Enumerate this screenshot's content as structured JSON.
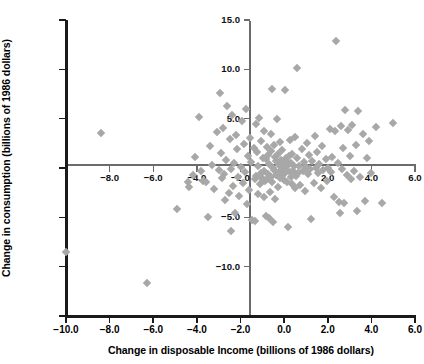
{
  "chart_data": {
    "type": "scatter",
    "title": "",
    "xlabel": "Change in disposable Income (billions of 1986 dollars)",
    "ylabel": "Change in consumption (billions of 1986 dollars)",
    "xlim": [
      -10.0,
      6.0
    ],
    "ylim": [
      -15.0,
      15.0
    ],
    "grid": false,
    "legend": "none",
    "marker": "diamond",
    "marker_color": "#a8a8a8",
    "axis_color": "#1a1a1a",
    "inner_axis_color": "#6b6b6b",
    "outer_xticks": [
      "-10.0",
      "-8.0",
      "-6.0",
      "-4.0",
      "-2.0",
      "0.0",
      "2.0",
      "4.0",
      "6.0"
    ],
    "outer_xtick_values": [
      -10.0,
      -8.0,
      -6.0,
      -4.0,
      -2.0,
      0.0,
      2.0,
      4.0,
      6.0
    ],
    "outer_yticks": [
      "15.0",
      "10.0",
      "5.0",
      "0.0",
      "-5.0",
      "-10.0",
      "-15.0"
    ],
    "outer_ytick_values": [
      15.0,
      10.0,
      5.0,
      0.0,
      -5.0,
      -10.0,
      -15.0
    ],
    "inner_xticks": [
      "-8.0",
      "-6.0",
      "-4.0",
      "-2.0",
      "2.0",
      "4.0",
      "6.0"
    ],
    "inner_xtick_values": [
      -8.0,
      -6.0,
      -4.0,
      -2.0,
      2.0,
      4.0,
      6.0
    ],
    "inner_yticks": [
      "15.0",
      "10.0",
      "5.0",
      "-5.0",
      "-10.0"
    ],
    "inner_ytick_values": [
      15.0,
      10.0,
      5.0,
      -5.0,
      -10.0
    ],
    "points": [
      [
        -10.0,
        -8.5
      ],
      [
        -8.4,
        3.5
      ],
      [
        -6.3,
        -11.7
      ],
      [
        -4.9,
        -4.2
      ],
      [
        -4.4,
        -1.4
      ],
      [
        -4.2,
        -0.7
      ],
      [
        -4.1,
        1.1
      ],
      [
        -3.8,
        -0.3
      ],
      [
        -3.7,
        -1.3
      ],
      [
        -3.6,
        -1.4
      ],
      [
        -3.5,
        -5.0
      ],
      [
        -3.4,
        2.2
      ],
      [
        -3.3,
        0.3
      ],
      [
        -3.2,
        -2.1
      ],
      [
        -3.1,
        3.6
      ],
      [
        -3.0,
        -0.2
      ],
      [
        -2.95,
        7.6
      ],
      [
        -2.9,
        1.5
      ],
      [
        -2.85,
        -1.0
      ],
      [
        -2.8,
        4.1
      ],
      [
        -2.75,
        -0.6
      ],
      [
        -2.7,
        -3.2
      ],
      [
        -2.65,
        0.8
      ],
      [
        -2.6,
        6.3
      ],
      [
        -2.55,
        -2.5
      ],
      [
        -2.5,
        2.9
      ],
      [
        -2.45,
        -0.1
      ],
      [
        -2.4,
        5.4
      ],
      [
        -2.35,
        -1.8
      ],
      [
        -2.3,
        0.5
      ],
      [
        -2.25,
        -4.6
      ],
      [
        -2.2,
        3.3
      ],
      [
        -2.15,
        1.9
      ],
      [
        -2.1,
        -0.9
      ],
      [
        -2.05,
        -2.8
      ],
      [
        -2.0,
        0.1
      ],
      [
        -1.95,
        4.8
      ],
      [
        -1.9,
        -1.5
      ],
      [
        -1.85,
        2.4
      ],
      [
        -1.8,
        -0.4
      ],
      [
        -1.75,
        6.0
      ],
      [
        -1.7,
        -3.6
      ],
      [
        -1.65,
        1.2
      ],
      [
        -1.6,
        -2.2
      ],
      [
        -1.55,
        3.0
      ],
      [
        -1.5,
        0.6
      ],
      [
        -1.45,
        -5.3
      ],
      [
        -1.4,
        2.0
      ],
      [
        -1.35,
        -1.1
      ],
      [
        -1.3,
        4.5
      ],
      [
        -1.28,
        -0.8
      ],
      [
        -1.25,
        1.6
      ],
      [
        -1.2,
        -2.6
      ],
      [
        -1.18,
        0.2
      ],
      [
        -1.15,
        5.1
      ],
      [
        -1.1,
        -1.6
      ],
      [
        -1.08,
        -0.5
      ],
      [
        -1.05,
        2.7
      ],
      [
        -1.0,
        -1.0
      ],
      [
        -0.98,
        1.0
      ],
      [
        -0.95,
        -1.2
      ],
      [
        -0.92,
        3.8
      ],
      [
        -0.9,
        -0.3
      ],
      [
        -0.88,
        -1.3
      ],
      [
        -0.85,
        0.9
      ],
      [
        -0.82,
        -4.9
      ],
      [
        -0.8,
        2.1
      ],
      [
        -0.78,
        -1.1
      ],
      [
        -0.75,
        -0.6
      ],
      [
        -0.72,
        1.3
      ],
      [
        -0.7,
        -5.1
      ],
      [
        -0.68,
        0.4
      ],
      [
        -0.65,
        -2.4
      ],
      [
        -0.62,
        3.4
      ],
      [
        -0.6,
        -0.9
      ],
      [
        -0.58,
        1.7
      ],
      [
        -0.55,
        -1.4
      ],
      [
        -0.52,
        0.0
      ],
      [
        -0.5,
        -5.5
      ],
      [
        -0.48,
        2.3
      ],
      [
        -0.45,
        -0.2
      ],
      [
        -0.42,
        1.1
      ],
      [
        -0.4,
        -3.1
      ],
      [
        -0.38,
        0.7
      ],
      [
        -0.35,
        -0.7
      ],
      [
        -0.32,
        5.0
      ],
      [
        -0.3,
        1.4
      ],
      [
        -0.28,
        -1.9
      ],
      [
        -0.25,
        0.3
      ],
      [
        -0.22,
        -0.4
      ],
      [
        -0.2,
        2.6
      ],
      [
        -0.18,
        -1.05
      ],
      [
        -0.15,
        0.8
      ],
      [
        -0.12,
        -0.15
      ],
      [
        -0.1,
        1.8
      ],
      [
        -0.08,
        -0.75
      ],
      [
        -0.05,
        0.45
      ],
      [
        -0.02,
        -1.25
      ],
      [
        0.0,
        0.15
      ],
      [
        0.02,
        7.9
      ],
      [
        0.05,
        -0.55
      ],
      [
        0.08,
        1.05
      ],
      [
        0.1,
        -0.25
      ],
      [
        0.12,
        0.65
      ],
      [
        0.15,
        -1.45
      ],
      [
        0.18,
        0.35
      ],
      [
        0.2,
        -6.0
      ],
      [
        0.22,
        1.25
      ],
      [
        0.25,
        -0.45
      ],
      [
        0.28,
        2.8
      ],
      [
        0.3,
        -0.95
      ],
      [
        0.32,
        0.55
      ],
      [
        0.35,
        -1.65
      ],
      [
        0.38,
        1.45
      ],
      [
        0.4,
        -0.35
      ],
      [
        0.45,
        0.25
      ],
      [
        0.5,
        -2.0
      ],
      [
        0.52,
        3.1
      ],
      [
        0.55,
        -0.85
      ],
      [
        0.6,
        1.0
      ],
      [
        0.65,
        -0.5
      ],
      [
        0.7,
        0.2
      ],
      [
        0.75,
        -1.7
      ],
      [
        0.8,
        1.9
      ],
      [
        0.85,
        -0.3
      ],
      [
        0.9,
        0.6
      ],
      [
        0.95,
        -2.3
      ],
      [
        1.0,
        0.1
      ],
      [
        1.05,
        2.5
      ],
      [
        1.1,
        -0.65
      ],
      [
        1.15,
        1.35
      ],
      [
        1.2,
        -0.15
      ],
      [
        1.3,
        0.75
      ],
      [
        1.35,
        -1.55
      ],
      [
        1.4,
        3.2
      ],
      [
        1.45,
        -0.05
      ],
      [
        1.5,
        1.6
      ],
      [
        1.55,
        -0.55
      ],
      [
        1.6,
        0.45
      ],
      [
        1.7,
        -2.05
      ],
      [
        1.75,
        2.2
      ],
      [
        1.8,
        -0.25
      ],
      [
        1.9,
        0.95
      ],
      [
        1.95,
        -1.35
      ],
      [
        2.0,
        0.05
      ],
      [
        2.1,
        4.0
      ],
      [
        2.15,
        -0.45
      ],
      [
        2.2,
        1.15
      ],
      [
        2.3,
        -2.9
      ],
      [
        2.35,
        3.7
      ],
      [
        2.4,
        12.9
      ],
      [
        2.45,
        0.55
      ],
      [
        2.5,
        -3.4
      ],
      [
        2.6,
        4.3
      ],
      [
        2.65,
        -0.15
      ],
      [
        2.7,
        2.05
      ],
      [
        2.75,
        -3.55
      ],
      [
        2.8,
        5.9
      ],
      [
        2.9,
        -0.75
      ],
      [
        2.95,
        3.9
      ],
      [
        3.0,
        1.25
      ],
      [
        3.05,
        -1.15
      ],
      [
        3.1,
        4.4
      ],
      [
        3.2,
        -0.35
      ],
      [
        3.3,
        2.35
      ],
      [
        3.4,
        5.8
      ],
      [
        3.5,
        -0.95
      ],
      [
        3.6,
        3.45
      ],
      [
        3.7,
        -3.3
      ],
      [
        3.8,
        1.05
      ],
      [
        3.9,
        2.75
      ],
      [
        4.0,
        -0.55
      ],
      [
        4.2,
        4.2
      ],
      [
        4.5,
        -3.5
      ],
      [
        5.0,
        4.6
      ],
      [
        0.6,
        10.1
      ],
      [
        -3.9,
        5.2
      ],
      [
        -2.42,
        -6.4
      ],
      [
        -1.32,
        -5.4
      ],
      [
        1.25,
        -5.15
      ],
      [
        2.55,
        -4.6
      ],
      [
        3.35,
        -4.35
      ],
      [
        -0.9,
        -2.95
      ],
      [
        -0.55,
        8.0
      ],
      [
        -4.35,
        -1.9
      ]
    ]
  }
}
